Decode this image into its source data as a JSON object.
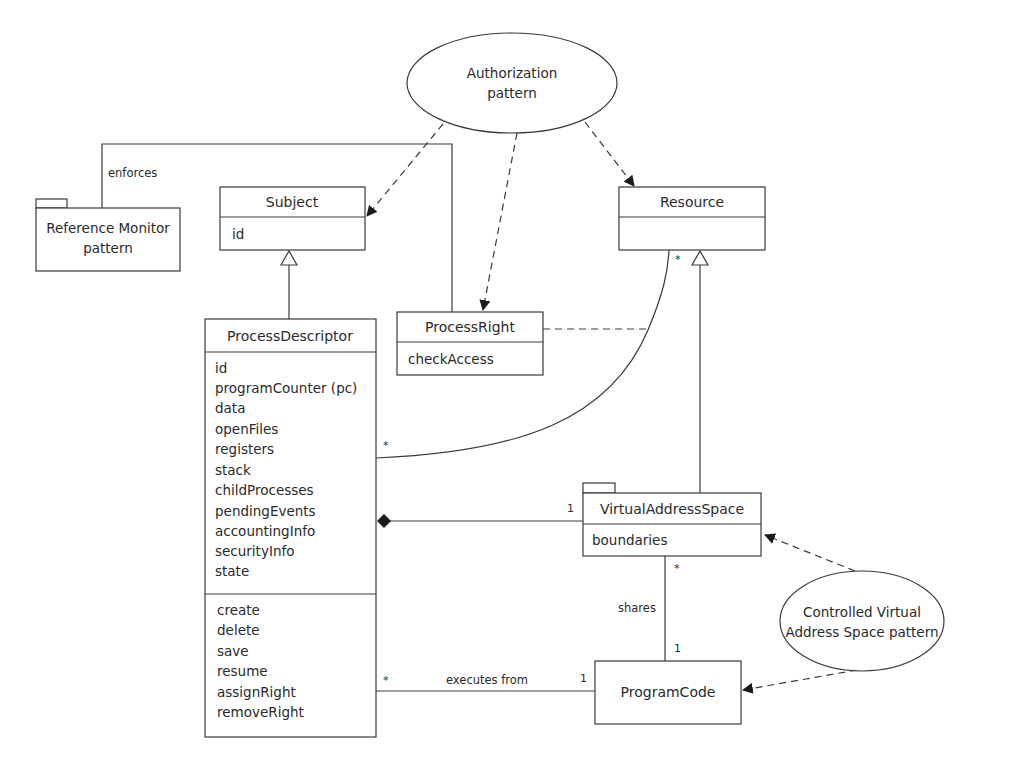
{
  "diagram": {
    "type": "uml-class-diagram",
    "patterns": {
      "authorization": {
        "line1": "Authorization",
        "line2": "pattern"
      },
      "reference_monitor": {
        "line1": "Reference Monitor",
        "line2": "pattern"
      },
      "controlled_vas": {
        "line1": "Controlled Virtual",
        "line2": "Address Space pattern"
      }
    },
    "classes": {
      "subject": {
        "name": "Subject",
        "attributes": [
          "id"
        ]
      },
      "resource": {
        "name": "Resource",
        "attributes": []
      },
      "process_right": {
        "name": "ProcessRight",
        "attributes": [
          "checkAccess"
        ]
      },
      "process_descriptor": {
        "name": "ProcessDescriptor",
        "attributes": [
          "id",
          "programCounter (pc)",
          "data",
          "openFiles",
          "registers",
          "stack",
          "childProcesses",
          "pendingEvents",
          "accountingInfo",
          "securityInfo",
          "state"
        ],
        "operations": [
          "create",
          "delete",
          "save",
          "resume",
          "assignRight",
          "removeRight"
        ]
      },
      "virtual_address_space": {
        "name": "VirtualAddressSpace",
        "attributes": [
          "boundaries"
        ]
      },
      "program_code": {
        "name": "ProgramCode"
      }
    },
    "associations": {
      "enforces": {
        "label": "enforces"
      },
      "process_resource": {
        "pd_mult": "*",
        "resource_mult": "*"
      },
      "composition_vas": {
        "vas_mult": "1"
      },
      "shares": {
        "label": "shares",
        "vas_mult": "*",
        "code_mult": "1"
      },
      "executes_from": {
        "label": "executes from",
        "pd_mult": "*",
        "code_mult": "1"
      }
    }
  }
}
